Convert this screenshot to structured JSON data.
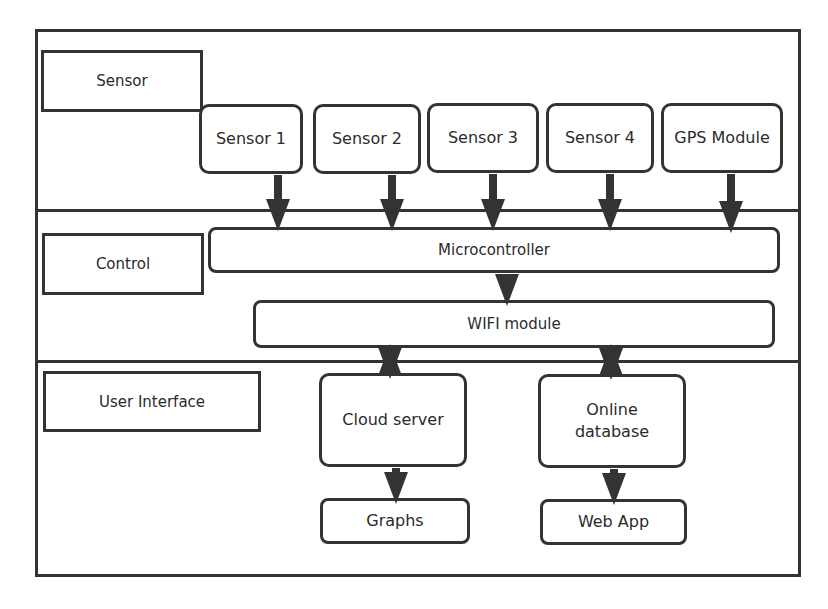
{
  "layers": {
    "sensor": {
      "label": "Sensor"
    },
    "control": {
      "label": "Control"
    },
    "user_interface": {
      "label": "User Interface"
    }
  },
  "sensor_layer": {
    "nodes": [
      {
        "label": "Sensor 1"
      },
      {
        "label": "Sensor 2"
      },
      {
        "label": "Sensor 3"
      },
      {
        "label": "Sensor 4"
      },
      {
        "label": "GPS Module"
      }
    ]
  },
  "control_layer": {
    "microcontroller": "Microcontroller",
    "wifi_module": "WIFI module"
  },
  "ui_layer": {
    "cloud_server": "Cloud server",
    "online_database_line1": "Online",
    "online_database_line2": "database",
    "graphs": "Graphs",
    "web_app": "Web App"
  },
  "colors": {
    "stroke": "#333333",
    "background": "#ffffff",
    "text": "#2b2b2b"
  }
}
